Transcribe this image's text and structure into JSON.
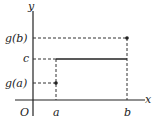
{
  "diagram": {
    "axes": {
      "x_label": "x",
      "y_label": "y",
      "origin_label": "O"
    },
    "x_ticks": [
      {
        "label": "a",
        "x": 56
      },
      {
        "label": "b",
        "x": 127
      }
    ],
    "y_ticks": [
      {
        "label": "g(b)",
        "y": 38
      },
      {
        "label": "c",
        "y": 59
      },
      {
        "label": "g(a)",
        "y": 83
      }
    ],
    "points": [
      {
        "name": "(a, g(a))",
        "x": 56,
        "y": 83
      },
      {
        "name": "(b, g(b))",
        "x": 127,
        "y": 38
      }
    ],
    "segments": {
      "solid": "horizontal line y = c from x = a to x = b, then vertical from c up to g(b) at b",
      "dashed": [
        "g(b) to b",
        "c to a",
        "g(a) to a",
        "a down to x-axis",
        "b down to x-axis"
      ]
    },
    "colors": {
      "stroke": "#222222",
      "background": "#ffffff"
    }
  }
}
